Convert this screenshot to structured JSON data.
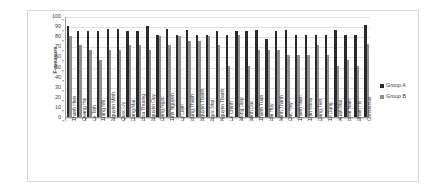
{
  "chart_data": {
    "type": "bar",
    "title": "",
    "xlabel": "",
    "ylabel": "F-measure",
    "ylim": [
      0,
      100
    ],
    "yticks": [
      0,
      10,
      20,
      30,
      40,
      50,
      60,
      70,
      80,
      90,
      100
    ],
    "grid": true,
    "legend_position": "right",
    "categories": [
      "Thanh Hien",
      "Quang Ha",
      "Le Tinh",
      "Trang Nhi",
      "Nguyen Minh",
      "Quoc Uy",
      "Dang Mai",
      "Hoa Thuong",
      "Nguyen Duy",
      "Dang Ngoc",
      "Tinh Nguyen",
      "Ly Liem",
      "Hung Thanh",
      "Nguyen Thanh",
      "Ngoc Mai",
      "Nguyen Thanh",
      "Le Chinh",
      "Mong Diep",
      "Minh Duc",
      "Thanh Tuan",
      "Hai Huy",
      "Minh Thanh",
      "Duc Huy",
      "Thanh Nam",
      "Tran Khoa",
      "Dang Tien",
      "Tri Dung",
      "Xuan Mai",
      "Hoai Nam",
      "Pham Ho",
      "Consensus"
    ],
    "series": [
      {
        "name": "Group A",
        "color": "#2a2a2a",
        "values": [
          90,
          85,
          85,
          85,
          87,
          87,
          85,
          85,
          90,
          81,
          87,
          81,
          86,
          81,
          81,
          85,
          81,
          85,
          85,
          86,
          77,
          85,
          86,
          81,
          81,
          81,
          81,
          86,
          81,
          81,
          91
        ]
      },
      {
        "name": "Group B",
        "color": "#8f8f8f",
        "values": [
          80,
          71,
          66,
          56,
          66,
          66,
          71,
          71,
          66,
          80,
          71,
          80,
          75,
          75,
          80,
          71,
          51,
          81,
          51,
          66,
          66,
          66,
          61,
          61,
          61,
          71,
          61,
          51,
          56,
          51,
          72
        ]
      }
    ]
  },
  "legend": {
    "items": [
      {
        "label": "Group A",
        "color": "#2a2a2a"
      },
      {
        "label": "Group B",
        "color": "#8f8f8f"
      }
    ]
  }
}
